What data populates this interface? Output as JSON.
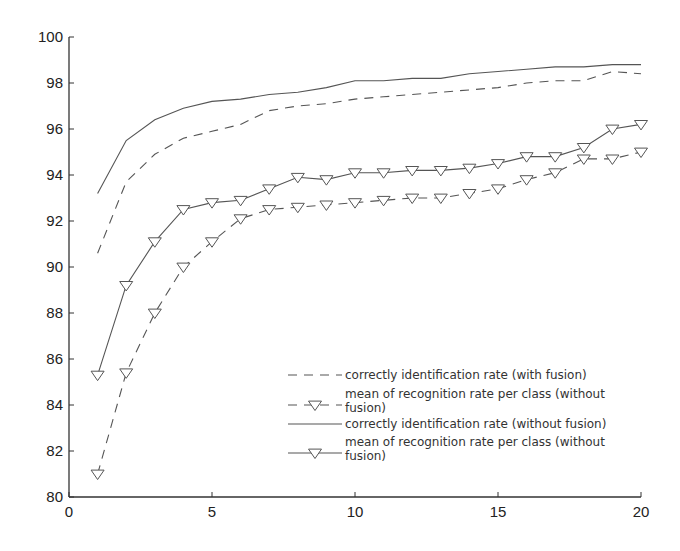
{
  "chart_data": {
    "type": "line",
    "title": "",
    "xlabel": "",
    "ylabel": "",
    "xlim": [
      0,
      20
    ],
    "ylim": [
      80,
      100
    ],
    "grid": false,
    "x_ticks": [
      0,
      5,
      10,
      15,
      20
    ],
    "y_ticks": [
      80,
      82,
      84,
      86,
      88,
      90,
      92,
      94,
      96,
      98,
      100
    ],
    "legend_position": "lower right (inside)",
    "x": [
      1,
      2,
      3,
      4,
      5,
      6,
      7,
      8,
      9,
      10,
      11,
      12,
      13,
      14,
      15,
      16,
      17,
      18,
      19,
      20
    ],
    "series": [
      {
        "name": "correctly identification rate (with fusion)",
        "style": "dashed",
        "marker": "none",
        "values": [
          90.6,
          93.7,
          94.9,
          95.6,
          95.9,
          96.2,
          96.8,
          97.0,
          97.1,
          97.3,
          97.4,
          97.5,
          97.6,
          97.7,
          97.8,
          98.0,
          98.1,
          98.1,
          98.5,
          98.4
        ]
      },
      {
        "name": "mean of recognition rate per class (without fusion)",
        "style": "dashed",
        "marker": "triangle-down",
        "values": [
          81.0,
          85.4,
          88.0,
          90.0,
          91.1,
          92.1,
          92.5,
          92.6,
          92.7,
          92.8,
          92.9,
          93.0,
          93.0,
          93.2,
          93.4,
          93.8,
          94.1,
          94.7,
          94.7,
          95.0
        ]
      },
      {
        "name": "correctly identification rate (without fusion)",
        "style": "solid",
        "marker": "none",
        "values": [
          93.2,
          95.5,
          96.4,
          96.9,
          97.2,
          97.3,
          97.5,
          97.6,
          97.8,
          98.1,
          98.1,
          98.2,
          98.2,
          98.4,
          98.5,
          98.6,
          98.7,
          98.7,
          98.8,
          98.8
        ]
      },
      {
        "name": "mean of recognition rate per class (without fusion)",
        "style": "solid",
        "marker": "triangle-down",
        "values": [
          85.3,
          89.2,
          91.1,
          92.5,
          92.8,
          92.9,
          93.4,
          93.9,
          93.8,
          94.1,
          94.1,
          94.2,
          94.2,
          94.3,
          94.5,
          94.8,
          94.8,
          95.2,
          96.0,
          96.2
        ]
      }
    ],
    "legend": [
      {
        "lines": [
          "correctly identification rate (with fusion)"
        ]
      },
      {
        "lines": [
          "mean of recognition rate per class (without",
          "fusion)"
        ]
      },
      {
        "lines": [
          "correctly identification rate (without fusion)"
        ]
      },
      {
        "lines": [
          "mean of recognition rate per class (without",
          "fusion)"
        ]
      }
    ]
  },
  "colors": {
    "line": "#555555",
    "axis": "#333333",
    "text": "#222222",
    "background": "#ffffff"
  }
}
